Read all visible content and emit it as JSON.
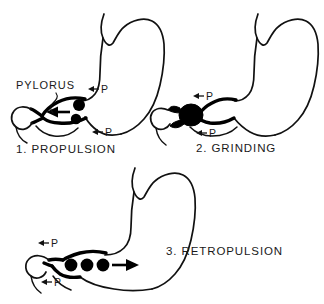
{
  "figure": {
    "background_color": "#ffffff",
    "ink_color": "#111111",
    "particle_color": "#000000"
  },
  "annotations": {
    "pylorus_label": "PYLORUS",
    "pressure_letter": "P"
  },
  "panels": [
    {
      "id": "propulsion",
      "number": "1.",
      "name": "PROPULSION",
      "caption": "1.  PROPULSION",
      "particle_count": 2,
      "flow_direction": "left",
      "pressure_labels": [
        "P",
        "P"
      ],
      "pylorus_state": "open"
    },
    {
      "id": "grinding",
      "number": "2.",
      "name": "GRINDING",
      "caption": "2.  GRINDING",
      "particle_count": 0,
      "flow_direction": "none",
      "pressure_labels": [
        "P",
        "P"
      ],
      "pylorus_state": "closed"
    },
    {
      "id": "retropulsion",
      "number": "3.",
      "name": "RETROPULSION",
      "caption": "3.  RETROPULSION",
      "particle_count": 3,
      "flow_direction": "right",
      "pressure_labels": [
        "P",
        "P"
      ],
      "pylorus_state": "closed"
    }
  ]
}
